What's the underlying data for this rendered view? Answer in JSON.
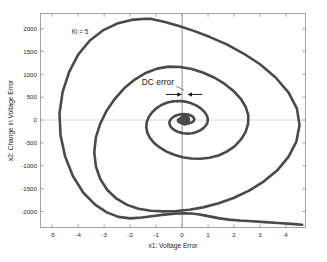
{
  "chart_data": {
    "type": "line",
    "title": "",
    "xlabel": "x1: Voltage Error",
    "ylabel": "x2: Change in Voltage Error",
    "xlim": [
      -5.45,
      4.75
    ],
    "ylim": [
      -2350,
      2330
    ],
    "xticks": [
      -5,
      -4,
      -3,
      -2,
      -1,
      0,
      1,
      2,
      3,
      4
    ],
    "xticklabels": [
      "-5",
      "-4",
      "-3",
      "-2",
      "-1",
      "0",
      "1",
      "2",
      "3",
      "4"
    ],
    "yticks": [
      2000,
      1500,
      1000,
      500,
      0,
      -500,
      -1000,
      -1500,
      -2000
    ],
    "yticklabels": [
      "2000",
      "1500",
      "1000",
      "500",
      "0",
      "-500",
      "-1000",
      "-1500",
      "-2000"
    ],
    "grid": false,
    "legend": null,
    "series": [
      {
        "name": "phase-trajectory",
        "color": "#4a4a4a",
        "linewidth": 2.6,
        "description": "Inward spiral in the voltage-error phase plane converging on a non-zero equilibrium offset from the origin",
        "points": [
          [
            4.62,
            -2290
          ],
          [
            4.2,
            -2270
          ],
          [
            3.7,
            -2250
          ],
          [
            3.2,
            -2232
          ],
          [
            2.7,
            -2214
          ],
          [
            2.2,
            -2198
          ],
          [
            1.8,
            -2178
          ],
          [
            1.45,
            -2150
          ],
          [
            1.15,
            -2118
          ],
          [
            0.9,
            -2090
          ],
          [
            0.62,
            -2062
          ],
          [
            0.35,
            -2045
          ],
          [
            0.05,
            -2040
          ],
          [
            -0.3,
            -2048
          ],
          [
            -0.7,
            -2068
          ],
          [
            -1.1,
            -2098
          ],
          [
            -1.55,
            -2132
          ],
          [
            -2.0,
            -2150
          ],
          [
            -2.45,
            -2118
          ],
          [
            -2.9,
            -2020
          ],
          [
            -3.35,
            -1850
          ],
          [
            -3.8,
            -1590
          ],
          [
            -4.2,
            -1230
          ],
          [
            -4.5,
            -800
          ],
          [
            -4.68,
            -330
          ],
          [
            -4.72,
            140
          ],
          [
            -4.6,
            610
          ],
          [
            -4.35,
            1050
          ],
          [
            -4.0,
            1430
          ],
          [
            -3.55,
            1740
          ],
          [
            -3.05,
            1960
          ],
          [
            -2.5,
            2110
          ],
          [
            -1.95,
            2190
          ],
          [
            -1.4,
            2215
          ],
          [
            -1.18,
            2212
          ],
          [
            -0.7,
            2150
          ],
          [
            -0.15,
            2060
          ],
          [
            0.45,
            1950
          ],
          [
            1.05,
            1820
          ],
          [
            1.7,
            1660
          ],
          [
            2.35,
            1460
          ],
          [
            3.0,
            1220
          ],
          [
            3.6,
            930
          ],
          [
            4.1,
            600
          ],
          [
            4.42,
            250
          ],
          [
            4.52,
            -110
          ],
          [
            4.4,
            -470
          ],
          [
            4.1,
            -800
          ],
          [
            3.68,
            -1090
          ],
          [
            3.15,
            -1340
          ],
          [
            2.58,
            -1545
          ],
          [
            1.98,
            -1705
          ],
          [
            1.38,
            -1825
          ],
          [
            0.8,
            -1910
          ],
          [
            0.28,
            -1960
          ],
          [
            -0.22,
            -1990
          ],
          [
            -0.72,
            -1998
          ],
          [
            -1.2,
            -1985
          ],
          [
            -1.68,
            -1940
          ],
          [
            -2.12,
            -1855
          ],
          [
            -2.52,
            -1720
          ],
          [
            -2.88,
            -1530
          ],
          [
            -3.15,
            -1290
          ],
          [
            -3.32,
            -1010
          ],
          [
            -3.38,
            -700
          ],
          [
            -3.32,
            -385
          ],
          [
            -3.15,
            -80
          ],
          [
            -2.9,
            210
          ],
          [
            -2.58,
            470
          ],
          [
            -2.22,
            700
          ],
          [
            -1.82,
            885
          ],
          [
            -1.4,
            1030
          ],
          [
            -0.96,
            1125
          ],
          [
            -0.52,
            1168
          ],
          [
            -0.08,
            1160
          ],
          [
            0.38,
            1115
          ],
          [
            0.82,
            1035
          ],
          [
            1.25,
            925
          ],
          [
            1.64,
            790
          ],
          [
            1.98,
            635
          ],
          [
            2.26,
            465
          ],
          [
            2.45,
            285
          ],
          [
            2.55,
            100
          ],
          [
            2.54,
            -85
          ],
          [
            2.44,
            -265
          ],
          [
            2.26,
            -430
          ],
          [
            2.02,
            -575
          ],
          [
            1.72,
            -692
          ],
          [
            1.4,
            -775
          ],
          [
            1.05,
            -825
          ],
          [
            0.7,
            -845
          ],
          [
            0.35,
            -840
          ],
          [
            0.02,
            -812
          ],
          [
            -0.3,
            -760
          ],
          [
            -0.6,
            -690
          ],
          [
            -0.86,
            -600
          ],
          [
            -1.08,
            -500
          ],
          [
            -1.24,
            -390
          ],
          [
            -1.34,
            -275
          ],
          [
            -1.38,
            -158
          ],
          [
            -1.36,
            -42
          ],
          [
            -1.28,
            70
          ],
          [
            -1.15,
            172
          ],
          [
            -0.98,
            262
          ],
          [
            -0.78,
            334
          ],
          [
            -0.56,
            384
          ],
          [
            -0.33,
            412
          ],
          [
            -0.09,
            418
          ],
          [
            0.14,
            402
          ],
          [
            0.36,
            366
          ],
          [
            0.56,
            314
          ],
          [
            0.73,
            250
          ],
          [
            0.86,
            178
          ],
          [
            0.95,
            102
          ],
          [
            0.99,
            26
          ],
          [
            0.98,
            -48
          ],
          [
            0.92,
            -117
          ],
          [
            0.82,
            -178
          ],
          [
            0.69,
            -228
          ],
          [
            0.54,
            -265
          ],
          [
            0.38,
            -288
          ],
          [
            0.21,
            -296
          ],
          [
            0.05,
            -290
          ],
          [
            -0.1,
            -270
          ],
          [
            -0.24,
            -238
          ],
          [
            -0.35,
            -198
          ],
          [
            -0.43,
            -152
          ],
          [
            -0.48,
            -102
          ],
          [
            -0.49,
            -52
          ],
          [
            -0.46,
            -4
          ],
          [
            -0.4,
            40
          ],
          [
            -0.31,
            77
          ],
          [
            -0.21,
            105
          ],
          [
            -0.09,
            123
          ],
          [
            0.03,
            130
          ],
          [
            0.15,
            127
          ],
          [
            0.26,
            114
          ],
          [
            0.35,
            94
          ],
          [
            0.42,
            68
          ],
          [
            0.46,
            40
          ],
          [
            0.47,
            11
          ],
          [
            0.45,
            -16
          ],
          [
            0.41,
            -40
          ],
          [
            0.34,
            -59
          ],
          [
            0.26,
            -72
          ],
          [
            0.18,
            -78
          ],
          [
            0.09,
            -78
          ],
          [
            0.01,
            -72
          ],
          [
            -0.06,
            -60
          ],
          [
            -0.12,
            -45
          ],
          [
            -0.15,
            -27
          ],
          [
            -0.16,
            -9
          ],
          [
            -0.15,
            8
          ],
          [
            -0.11,
            23
          ],
          [
            -0.06,
            34
          ],
          [
            0.0,
            41
          ],
          [
            0.07,
            42
          ],
          [
            0.13,
            39
          ],
          [
            0.18,
            32
          ],
          [
            0.22,
            22
          ],
          [
            0.24,
            10
          ],
          [
            0.24,
            -2
          ],
          [
            0.22,
            -13
          ],
          [
            0.19,
            -22
          ],
          [
            0.15,
            -28
          ],
          [
            0.1,
            -31
          ],
          [
            0.06,
            -30
          ],
          [
            0.02,
            -26
          ],
          [
            -0.01,
            -19
          ],
          [
            -0.03,
            -11
          ],
          [
            -0.03,
            -2
          ],
          [
            -0.02,
            7
          ],
          [
            0.01,
            14
          ],
          [
            0.05,
            18
          ],
          [
            0.09,
            19
          ],
          [
            0.12,
            17
          ],
          [
            0.15,
            12
          ],
          [
            0.16,
            6
          ],
          [
            0.16,
            0
          ],
          [
            0.15,
            -5
          ],
          [
            0.13,
            -9
          ],
          [
            0.11,
            -11
          ],
          [
            0.09,
            -11
          ],
          [
            0.07,
            -9
          ],
          [
            0.06,
            -6
          ],
          [
            0.06,
            -2
          ],
          [
            0.07,
            2
          ],
          [
            0.09,
            5
          ],
          [
            0.11,
            6
          ],
          [
            0.12,
            5
          ],
          [
            0.13,
            3
          ],
          [
            0.13,
            0
          ],
          [
            0.12,
            -2
          ],
          [
            0.11,
            -4
          ],
          [
            0.1,
            -4
          ],
          [
            0.09,
            -3
          ],
          [
            0.09,
            -1
          ],
          [
            0.1,
            1
          ],
          [
            0.11,
            2
          ],
          [
            0.11,
            1
          ],
          [
            0.11,
            0
          ],
          [
            0.1,
            -1
          ],
          [
            0.1,
            0
          ],
          [
            0.105,
            0
          ]
        ]
      }
    ],
    "annotations": [
      {
        "name": "gain-label",
        "text": "Ki = 5",
        "x": -4.25,
        "y": 1880
      },
      {
        "name": "dc-error-label",
        "text": "DC error",
        "x": -1.55,
        "y": 760
      },
      {
        "name": "dc-error-measure",
        "type": "double-arrow",
        "x_from": -0.62,
        "x_to": 0.78,
        "gap_from": -0.02,
        "gap_to": 0.22,
        "y": 560
      },
      {
        "name": "equilibrium-marker",
        "type": "point",
        "x": 0.1,
        "y": 0
      }
    ],
    "axis_lines": {
      "x_zero_line": 0,
      "y_zero_line": 0,
      "color": "#8f8f8f"
    },
    "colors": {
      "trajectory": "#4a4a4a",
      "frame": "#9a9a9a",
      "zero_axis": "#8f8f8f",
      "text": "#1d1d1d",
      "background": "#ffffff"
    }
  }
}
